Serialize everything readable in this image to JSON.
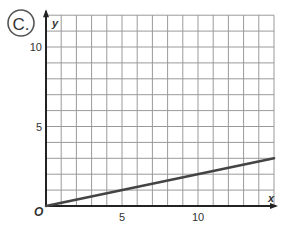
{
  "badge": {
    "label": "C."
  },
  "chart_data": {
    "type": "line",
    "title": "",
    "xlabel": "x",
    "ylabel": "y",
    "origin_label": "O",
    "xlim": [
      0,
      15
    ],
    "ylim": [
      0,
      12
    ],
    "grid": true,
    "grid_step": 1,
    "xticks": [
      5,
      10
    ],
    "xtick_labels": [
      "5",
      "10"
    ],
    "yticks": [
      5,
      10
    ],
    "ytick_labels": [
      "5",
      "10"
    ],
    "series": [
      {
        "name": "line",
        "x": [
          0,
          15
        ],
        "y": [
          0,
          3
        ]
      }
    ],
    "colors": {
      "line": "#444444",
      "grid": "#9a9a9a",
      "axis": "#222222"
    }
  }
}
